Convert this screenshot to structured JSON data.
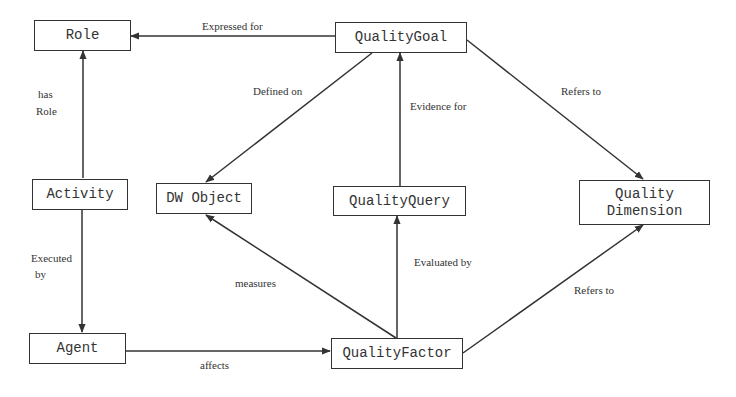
{
  "diagram": {
    "nodes": {
      "role": "Role",
      "quality_goal": "QualityGoal",
      "activity": "Activity",
      "dw_object": "DW Object",
      "quality_query": "QualityQuery",
      "quality_dimension_line1": "Quality",
      "quality_dimension_line2": "Dimension",
      "agent": "Agent",
      "quality_factor": "QualityFactor"
    },
    "edges": {
      "expressed_for": "Expressed for",
      "has_role_line1": "has",
      "has_role_line2": "Role",
      "defined_on": "Defined on",
      "evidence_for": "Evidence for",
      "goal_refers_to": "Refers to",
      "executed_by_line1": "Executed",
      "executed_by_line2": "by",
      "measures": "measures",
      "evaluated_by": "Evaluated by",
      "factor_refers_to": "Refers to",
      "affects": "affects"
    },
    "colors": {
      "line": "#333333",
      "background_text": "#d9d9d9"
    }
  }
}
